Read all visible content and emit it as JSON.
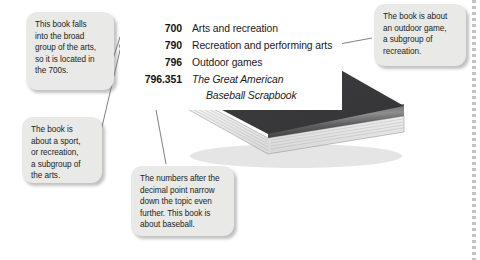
{
  "figure": {
    "book_color": "#3a3a3c",
    "callout_bg": "#e9e9e7",
    "text_color": "#231f20"
  },
  "dewey_list": {
    "rows": [
      {
        "number": "700",
        "label": "Arts and recreation",
        "italic": false
      },
      {
        "number": "790",
        "label": "Recreation and performing arts",
        "italic": false
      },
      {
        "number": "796",
        "label": "Outdoor games",
        "italic": false
      },
      {
        "number": "796.351",
        "label": "The Great American",
        "italic": true
      }
    ],
    "title_second_line": "Baseball Scrapbook"
  },
  "callouts": {
    "broad_group": {
      "name": "callout-broad-group",
      "lines": [
        "This book falls",
        "into the broad",
        "group of the arts,",
        "so it is located in",
        "the 700s."
      ]
    },
    "sport": {
      "name": "callout-sport",
      "lines": [
        "The book is",
        "about a sport,",
        "or recreation,",
        "a subgroup of",
        "the arts."
      ]
    },
    "decimal": {
      "name": "callout-decimal",
      "lines": [
        "The numbers after the",
        "decimal point narrow",
        "down the topic even",
        "further. This book is",
        "about baseball."
      ]
    },
    "outdoor": {
      "name": "callout-outdoor",
      "lines": [
        "The book is about",
        "an outdoor game,",
        "a subgroup of",
        "recreation."
      ]
    }
  }
}
